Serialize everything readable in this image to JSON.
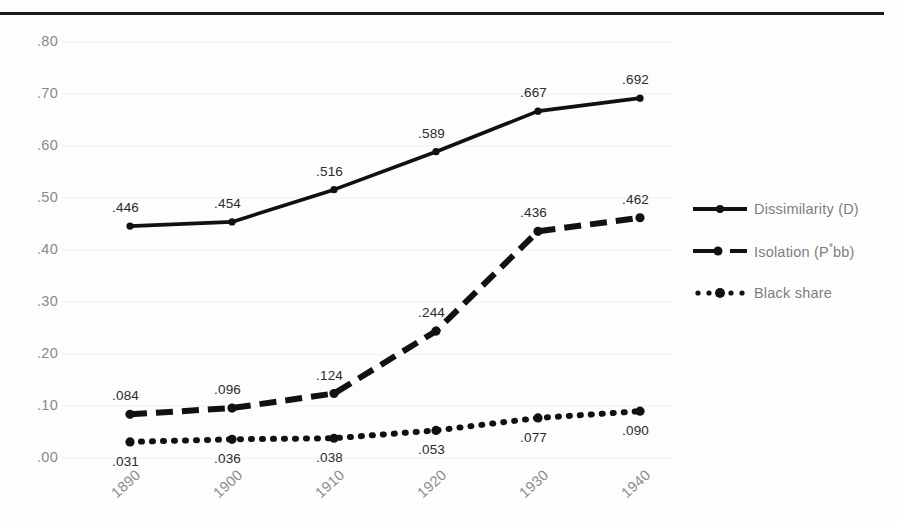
{
  "chart_data": {
    "type": "line",
    "title": "",
    "xlabel": "",
    "ylabel": "",
    "categories": [
      "1890",
      "1900",
      "1910",
      "1920",
      "1930",
      "1940"
    ],
    "ylim": [
      0.0,
      0.8
    ],
    "ytick_labels": [
      ".80",
      ".70",
      ".60",
      ".50",
      ".40",
      ".30",
      ".20",
      ".10",
      ".00"
    ],
    "ytick_values": [
      0.8,
      0.7,
      0.6,
      0.5,
      0.4,
      0.3,
      0.2,
      0.1,
      0.0
    ],
    "grid": true,
    "legend_position": "right",
    "series": [
      {
        "name": "Dissimilarity (D)",
        "style": "solid",
        "values": [
          0.446,
          0.454,
          0.516,
          0.589,
          0.667,
          0.692
        ],
        "data_labels": [
          ".446",
          ".454",
          ".516",
          ".589",
          ".667",
          ".692"
        ]
      },
      {
        "name": "Isolation (P*bb)",
        "name_prefix": "Isolation (P",
        "name_sup": "*",
        "name_suffix": "bb)",
        "style": "dashed",
        "values": [
          0.084,
          0.096,
          0.124,
          0.244,
          0.436,
          0.462
        ],
        "data_labels": [
          ".084",
          ".096",
          ".124",
          ".244",
          ".436",
          ".462"
        ]
      },
      {
        "name": "Black share",
        "style": "dotted",
        "values": [
          0.031,
          0.036,
          0.038,
          0.053,
          0.077,
          0.09
        ],
        "data_labels": [
          ".031",
          ".036",
          ".038",
          ".053",
          ".077",
          ".090"
        ]
      }
    ],
    "colors": {
      "line": "#111111",
      "tick_text": "#8a8a8a",
      "label_text": "#2b2b2b",
      "legend_text": "#7d7d7d",
      "grid": "#efefef",
      "background": "#fdfdfd",
      "top_rule": "#1a1a1a"
    }
  }
}
